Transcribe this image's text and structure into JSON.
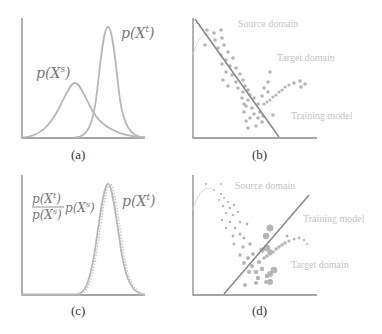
{
  "panels": {
    "a": {
      "caption": "(a)",
      "labels": {
        "source": "p(X",
        "source_sup": "s",
        "target": "p(X",
        "target_sup": "t",
        "close": ")"
      }
    },
    "b": {
      "caption": "(b)",
      "labels": {
        "source": "Source domain",
        "target": "Target domain",
        "model": "Training model"
      }
    },
    "c": {
      "caption": "(c)",
      "labels": {
        "frac_num": "p(X",
        "frac_num_sup": "t",
        "frac_den": "p(X",
        "frac_den_sup": "s",
        "weighted": "p(X",
        "weighted_sup": "s",
        "target": "p(X",
        "target_sup": "t",
        "close": ")"
      }
    },
    "d": {
      "caption": "(d)",
      "labels": {
        "source": "Source domain",
        "target": "Target domain",
        "model": "Training model"
      }
    }
  },
  "colors": {
    "curve": "#b8b8b8",
    "axis": "#888888",
    "model_line": "#8a8a8a",
    "points": "#b5b5b5",
    "domain_text": "#c4c4c4",
    "math_text": "#777777"
  }
}
